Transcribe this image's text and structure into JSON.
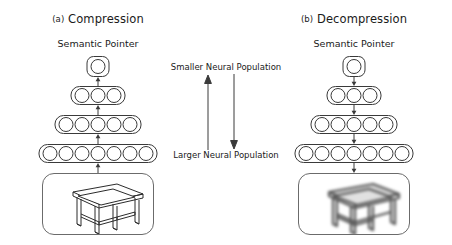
{
  "figure": {
    "background_color": "#ffffff",
    "stroke_color": "#3a3a3a"
  },
  "panels": [
    {
      "id": "compression",
      "index_label": "(a)",
      "title": "Compression",
      "top_label": "Semantic Pointer",
      "flow_direction": "up",
      "layers": [
        {
          "name": "semantic-pointer-layer",
          "nodes": 1
        },
        {
          "name": "hidden-layer-3",
          "nodes": 3
        },
        {
          "name": "hidden-layer-5",
          "nodes": 5
        },
        {
          "name": "input-layer-7",
          "nodes": 7
        }
      ],
      "image": {
        "name": "table-line-drawing",
        "style": "sharp",
        "subject": "table"
      }
    },
    {
      "id": "decompression",
      "index_label": "(b)",
      "title": "Decompression",
      "top_label": "Semantic Pointer",
      "flow_direction": "down",
      "layers": [
        {
          "name": "semantic-pointer-layer",
          "nodes": 1
        },
        {
          "name": "hidden-layer-3",
          "nodes": 3
        },
        {
          "name": "hidden-layer-5",
          "nodes": 5
        },
        {
          "name": "output-layer-7",
          "nodes": 7
        }
      ],
      "image": {
        "name": "table-line-drawing",
        "style": "blurred",
        "subject": "table"
      }
    }
  ],
  "center_legend": {
    "top_label": "Smaller Neural Population",
    "bottom_label": "Larger Neural Population",
    "left_arrow_direction": "up",
    "right_arrow_direction": "down"
  }
}
